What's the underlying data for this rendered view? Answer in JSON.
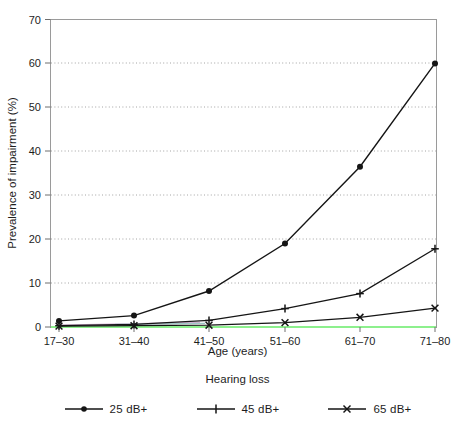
{
  "chart_data": {
    "type": "line",
    "title": "",
    "xlabel": "Age (years)",
    "ylabel": "Prevalence of impairment (%)",
    "categories": [
      "17–30",
      "31–40",
      "41–50",
      "51–60",
      "61–70",
      "71–80"
    ],
    "ylim": [
      0,
      70
    ],
    "yticks": [
      0,
      10,
      20,
      30,
      40,
      50,
      60,
      70
    ],
    "grid": "horizontal-dotted",
    "legend_title": "Hearing loss",
    "legend_position": "bottom-center",
    "series": [
      {
        "name": "25 dB+",
        "marker": "filled-circle",
        "color": "#151515",
        "values": [
          1.4,
          2.6,
          8.2,
          19.0,
          36.5,
          60.0
        ]
      },
      {
        "name": "45 dB+",
        "marker": "plus-bar",
        "color": "#151515",
        "values": [
          0.3,
          0.6,
          1.5,
          4.2,
          7.6,
          17.8
        ]
      },
      {
        "name": "65 dB+",
        "marker": "x-cross",
        "color": "#151515",
        "values": [
          0.2,
          0.3,
          0.4,
          1.0,
          2.2,
          4.3
        ]
      }
    ]
  },
  "axes": {
    "ytick_labels": [
      "0",
      "10",
      "20",
      "30",
      "40",
      "50",
      "60",
      "70"
    ],
    "xtick_labels": [
      "17–30",
      "31–40",
      "41–50",
      "51–60",
      "61–70",
      "71–80"
    ],
    "x_axis_title": "Age (years)",
    "y_axis_title": "Prevalence of impairment (%)"
  },
  "legend": {
    "title": "Hearing loss",
    "items": [
      {
        "label": "25 dB+",
        "marker": "filled-circle"
      },
      {
        "label": "45 dB+",
        "marker": "plus-bar"
      },
      {
        "label": "65 dB+",
        "marker": "x-cross"
      }
    ]
  },
  "colors": {
    "line": "#151515",
    "frame": "#9a9a9a",
    "grid": "#9a9a9a",
    "baseline_artifact": "#8df08d",
    "text": "#1d1d1d"
  }
}
